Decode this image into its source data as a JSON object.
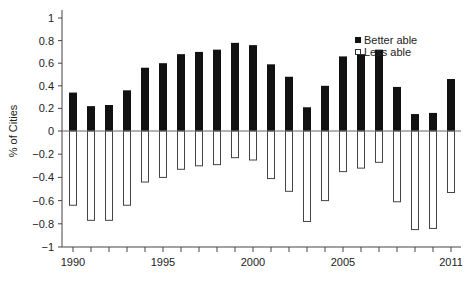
{
  "chart_data": {
    "type": "bar",
    "title": "",
    "xlabel": "",
    "ylabel": "% of Cities",
    "ylim": [
      -1,
      1
    ],
    "yticks": [
      1,
      0.8,
      0.6,
      0.4,
      0.2,
      0,
      -0.2,
      -0.4,
      -0.6,
      -0.8,
      -1
    ],
    "ytick_labels": [
      "1",
      "0.8",
      "0.6",
      "0.4",
      "0.2",
      "0",
      "−0.2",
      "−0.4",
      "−0.6",
      "−0.8",
      "−1"
    ],
    "x": [
      1990,
      1991,
      1992,
      1993,
      1994,
      1995,
      1996,
      1997,
      1998,
      1999,
      2000,
      2001,
      2002,
      2003,
      2004,
      2005,
      2006,
      2007,
      2008,
      2009,
      2010,
      2011
    ],
    "xtick_labels": [
      {
        "year": 1990,
        "label": "1990"
      },
      {
        "year": 1995,
        "label": "1995"
      },
      {
        "year": 2000,
        "label": "2000"
      },
      {
        "year": 2005,
        "label": "2005"
      },
      {
        "year": 2011,
        "label": "2011"
      }
    ],
    "grid": false,
    "legend_position": "upper right",
    "series": [
      {
        "name": "Better able",
        "color": "#111111",
        "fill": "solid",
        "values": [
          0.34,
          0.22,
          0.23,
          0.36,
          0.56,
          0.6,
          0.68,
          0.7,
          0.72,
          0.78,
          0.76,
          0.59,
          0.48,
          0.21,
          0.4,
          0.66,
          0.68,
          0.72,
          0.39,
          0.15,
          0.16,
          0.46
        ]
      },
      {
        "name": "Less able",
        "color": "#ffffff",
        "fill": "hollow",
        "values": [
          -0.64,
          -0.77,
          -0.77,
          -0.64,
          -0.44,
          -0.4,
          -0.33,
          -0.3,
          -0.29,
          -0.23,
          -0.25,
          -0.41,
          -0.52,
          -0.78,
          -0.6,
          -0.35,
          -0.32,
          -0.27,
          -0.61,
          -0.85,
          -0.84,
          -0.53
        ]
      }
    ]
  },
  "legend": {
    "items": [
      {
        "label": "Better able",
        "swatch": "filled-square"
      },
      {
        "label": "Less able",
        "swatch": "hollow-square"
      }
    ]
  },
  "axis": {
    "ylabel": "% of Cities"
  }
}
